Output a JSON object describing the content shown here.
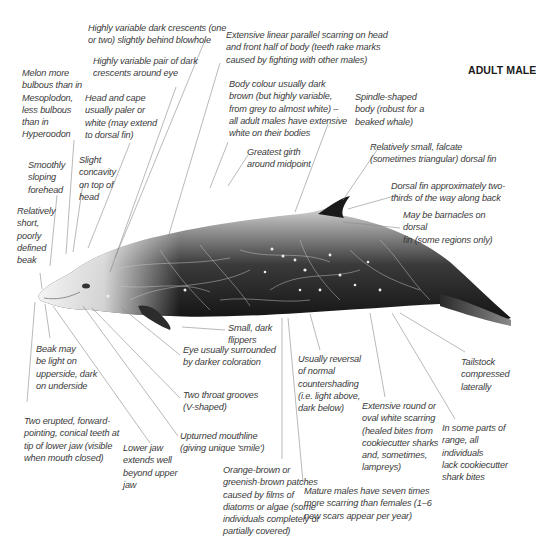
{
  "title": "ADULT MALE",
  "annotations": [
    {
      "id": "crescents_blowhole",
      "text": "Highly variable dark crescents (one\nor two) slightly behind blowhole",
      "x": 88,
      "y": 22
    },
    {
      "id": "scarring_linear",
      "text": "Extensive linear parallel scarring on head\nand front half of body (teeth rake marks\ncaused by fighting with other males)",
      "x": 226,
      "y": 29
    },
    {
      "id": "crescents_eye",
      "text": "Highly variable pair of dark\ncrescents around eye",
      "x": 93,
      "y": 55
    },
    {
      "id": "melon",
      "text": "Melon more\nbulbous than in\nMesoplodon,\nless bulbous\nthan in\nHyperoodon",
      "x": 22,
      "y": 67
    },
    {
      "id": "body_colour",
      "text": "Body colour usually dark\nbrown (but highly variable,\nfrom grey to almost white) –\nall adult males have extensive\nwhite on their bodies",
      "x": 229,
      "y": 78
    },
    {
      "id": "head_cape",
      "text": "Head and cape\nusually paler or\nwhite (may extend\nto dorsal fin)",
      "x": 85,
      "y": 92
    },
    {
      "id": "spindle",
      "text": "Spindle-shaped\nbody (robust for a\nbeaked whale)",
      "x": 355,
      "y": 91
    },
    {
      "id": "greatest_girth",
      "text": "Greatest girth\naround midpoint",
      "x": 247,
      "y": 146
    },
    {
      "id": "dorsal_small",
      "text": "Relatively small, falcate\n(sometimes triangular) dorsal fin",
      "x": 370,
      "y": 141
    },
    {
      "id": "forehead",
      "text": "Smoothly\nsloping\nforehead",
      "x": 28,
      "y": 159
    },
    {
      "id": "concavity",
      "text": "Slight\nconcavity\non top of\nhead",
      "x": 79,
      "y": 154
    },
    {
      "id": "dorsal_position",
      "text": "Dorsal fin approximately two-\nthirds of the way along back",
      "x": 391,
      "y": 180
    },
    {
      "id": "beak_short",
      "text": "Relatively\nshort,\npoorly\ndefined\nbeak",
      "x": 17,
      "y": 205
    },
    {
      "id": "barnacles",
      "text": "May be barnacles on dorsal\nfin (some regions only)",
      "x": 403,
      "y": 209
    },
    {
      "id": "flippers",
      "text": "Small, dark\nflippers",
      "x": 228,
      "y": 322
    },
    {
      "id": "beak_light",
      "text": "Beak may\nbe light on\nupperside, dark\non underside",
      "x": 36,
      "y": 343
    },
    {
      "id": "eye",
      "text": "Eye usually surrounded\nby darker coloration",
      "x": 183,
      "y": 344
    },
    {
      "id": "countershading",
      "text": "Usually reversal\nof normal\ncountershading\n(i.e. light above,\ndark below)",
      "x": 298,
      "y": 353
    },
    {
      "id": "tailstock",
      "text": "Tailstock\ncompressed\nlaterally",
      "x": 461,
      "y": 356
    },
    {
      "id": "throat_grooves",
      "text": "Two throat grooves\n(V-shaped)",
      "x": 183,
      "y": 389
    },
    {
      "id": "round_scarring",
      "text": "Extensive round or\noval white scarring\n(healed bites from\ncookiecutter sharks\nand, sometimes,\nlampreys)",
      "x": 362,
      "y": 400
    },
    {
      "id": "cookiecutter_absent",
      "text": "In some parts of\nrange, all individuals\nlack cookiecutter\nshark bites",
      "x": 442,
      "y": 422
    },
    {
      "id": "teeth",
      "text": "Two erupted, forward-\npointing, conical teeth at\ntip of lower jaw (visible\nwhen mouth closed)",
      "x": 24,
      "y": 415
    },
    {
      "id": "upturned_mouth",
      "text": "Upturned mouthline\n(giving unique 'smile')",
      "x": 180,
      "y": 430
    },
    {
      "id": "lower_jaw",
      "text": "Lower jaw\nextends well\nbeyond upper\njaw",
      "x": 123,
      "y": 442
    },
    {
      "id": "orange_patches",
      "text": "Orange-brown or\ngreenish-brown patches\ncaused by films of\ndiatoms or algae (some\nindividuals completely or\npartially covered)",
      "x": 223,
      "y": 464
    },
    {
      "id": "mature_males",
      "text": "Mature males have seven times\nmore scarring than females (1–6\nnew scars appear per year)",
      "x": 304,
      "y": 485
    }
  ],
  "leader_color": "#8a8a8a",
  "whale_colors": {
    "dark": "#1e1e1e",
    "mid": "#555555",
    "light": "#e6e6e6",
    "head": "#d9d9d9"
  }
}
